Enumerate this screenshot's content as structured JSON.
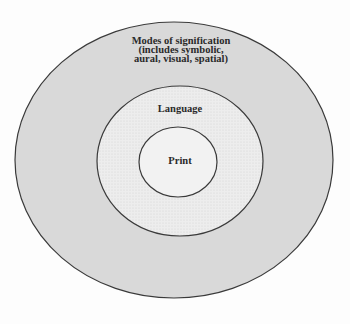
{
  "diagram": {
    "type": "nested-circles",
    "colors": {
      "outer_fill": "#d9d9d9",
      "middle_fill": "#ececec",
      "inner_fill": "#f4f4f4",
      "stroke": "#3a3a3a"
    },
    "rings": [
      {
        "id": "outer",
        "label_lines": [
          "Modes of signification",
          "(includes symbolic,",
          "aural, visual, spatial)"
        ]
      },
      {
        "id": "middle",
        "label": "Language"
      },
      {
        "id": "inner",
        "label": "Print"
      }
    ]
  }
}
